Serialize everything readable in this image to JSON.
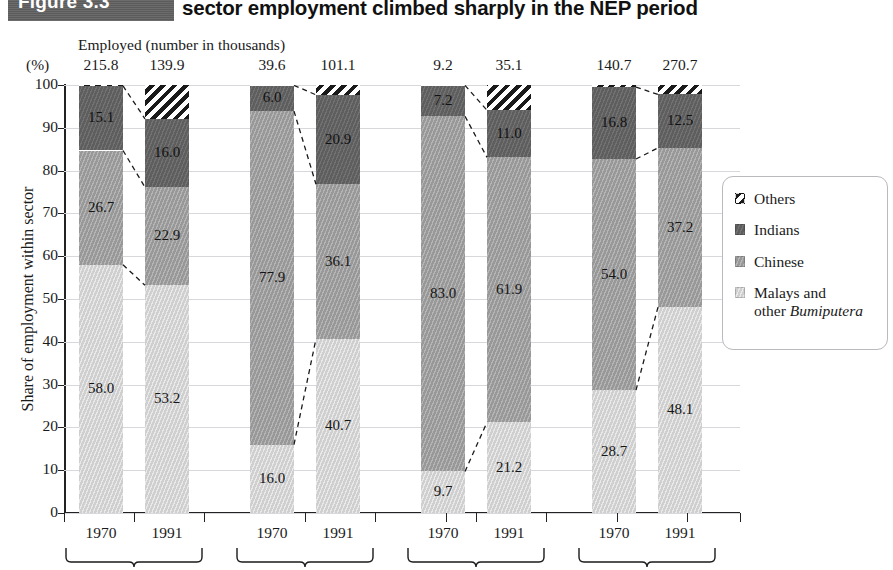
{
  "title": {
    "figure_tag": "Figure 3.3",
    "text": "sector employment climbed sharply in the NEP period"
  },
  "axes": {
    "pct_label": "(%)",
    "employed_caption": "Employed (number in thousands)",
    "ylabel": "Share of employment within sector",
    "yticks": [
      "0",
      "10",
      "20",
      "30",
      "40",
      "50",
      "60",
      "70",
      "80",
      "90",
      "100"
    ]
  },
  "legend": {
    "items": [
      {
        "key": "others",
        "label": "Others",
        "label_html": "Others",
        "color": "#ffffff"
      },
      {
        "key": "indians",
        "label": "Indians",
        "label_html": "Indians",
        "color": "#5e5e5e"
      },
      {
        "key": "chinese",
        "label": "Chinese",
        "label_html": "Chinese",
        "color": "#989898"
      },
      {
        "key": "malays",
        "label": "Malays and other Bumiputera",
        "label_html": "Malays and<br>other <i>Bumiputera</i>",
        "color": "#cfcfcf"
      }
    ]
  },
  "chart_data": {
    "type": "bar",
    "subtype": "stacked-100-percent",
    "title": "sector employment climbed sharply in the NEP period",
    "xlabel": "",
    "ylabel": "Share of employment within sector",
    "ylim": [
      0,
      100
    ],
    "yticks": [
      0,
      10,
      20,
      30,
      40,
      50,
      60,
      70,
      80,
      90,
      100
    ],
    "grid": true,
    "legend_position": "right",
    "series_order": [
      "Malays and other Bumiputera",
      "Chinese",
      "Indians",
      "Others"
    ],
    "categories": [
      "1970",
      "1991",
      "1970",
      "1991",
      "1970",
      "1991",
      "1970",
      "1991"
    ],
    "groups": [
      {
        "bars": [
          {
            "year": "1970",
            "employed": "215.8",
            "malays": 58.0,
            "chinese": 26.7,
            "indians": 15.1,
            "others": 0.2,
            "labels": {
              "malays": "58.0",
              "chinese": "26.7",
              "indians": "15.1",
              "others": ""
            }
          },
          {
            "year": "1991",
            "employed": "139.9",
            "malays": 53.2,
            "chinese": 22.9,
            "indians": 16.0,
            "others": 7.9,
            "labels": {
              "malays": "53.2",
              "chinese": "22.9",
              "indians": "16.0",
              "others": ""
            }
          }
        ]
      },
      {
        "bars": [
          {
            "year": "1970",
            "employed": "39.6",
            "malays": 16.0,
            "chinese": 77.9,
            "indians": 6.0,
            "others": 0.1,
            "labels": {
              "malays": "16.0",
              "chinese": "77.9",
              "indians": "6.0",
              "others": ""
            }
          },
          {
            "year": "1991",
            "employed": "101.1",
            "malays": 40.7,
            "chinese": 36.1,
            "indians": 20.9,
            "others": 2.3,
            "labels": {
              "malays": "40.7",
              "chinese": "36.1",
              "indians": "20.9",
              "others": ""
            }
          }
        ]
      },
      {
        "bars": [
          {
            "year": "1970",
            "employed": "9.2",
            "malays": 9.7,
            "chinese": 83.0,
            "indians": 7.2,
            "others": 0.1,
            "labels": {
              "malays": "9.7",
              "chinese": "83.0",
              "indians": "7.2",
              "others": ""
            }
          },
          {
            "year": "1991",
            "employed": "35.1",
            "malays": 21.2,
            "chinese": 61.9,
            "indians": 11.0,
            "others": 5.9,
            "labels": {
              "malays": "21.2",
              "chinese": "61.9",
              "indians": "11.0",
              "others": ""
            }
          }
        ]
      },
      {
        "bars": [
          {
            "year": "1970",
            "employed": "140.7",
            "malays": 28.7,
            "chinese": 54.0,
            "indians": 16.8,
            "others": 0.5,
            "labels": {
              "malays": "28.7",
              "chinese": "54.0",
              "indians": "16.8",
              "others": ""
            }
          },
          {
            "year": "1991",
            "employed": "270.7",
            "malays": 48.1,
            "chinese": 37.2,
            "indians": 12.5,
            "others": 2.2,
            "labels": {
              "malays": "48.1",
              "chinese": "37.2",
              "indians": "12.5",
              "others": ""
            }
          }
        ]
      }
    ]
  }
}
